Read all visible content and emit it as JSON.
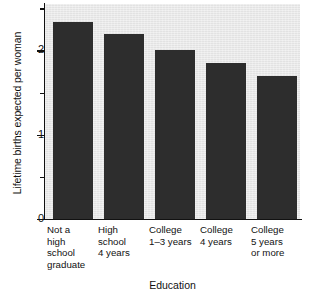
{
  "chart_data": {
    "type": "bar",
    "title": "",
    "xlabel": "Education",
    "ylabel": "Lifetime births expected per woman",
    "categories": [
      "Not a\nhigh\nschool\ngraduate",
      "High\nschool\n4 years",
      "College\n1–3 years",
      "College\n4 years",
      "College\n5 years\nor more"
    ],
    "values": [
      2.34,
      2.2,
      2.0,
      1.85,
      1.7
    ],
    "ylim": [
      0,
      2.55
    ],
    "yticks": [
      0,
      1,
      2
    ],
    "ytick_labels": [
      "0",
      "1",
      "2"
    ],
    "yticks_minor": [
      0.5,
      1.5,
      2.5
    ],
    "grid": false,
    "legend": "none",
    "bar_color": "#2d2d2d",
    "plot_background": "#e9e9e9",
    "page_background": "#ffffff",
    "axis_color": "#111111"
  }
}
